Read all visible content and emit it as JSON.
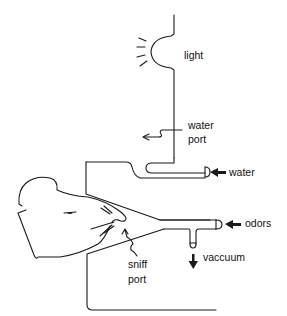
{
  "diagram": {
    "stroke_color": "#1a1a1a",
    "background": "#ffffff",
    "labels": {
      "light": "light",
      "water_port_line1": "water",
      "water_port_line2": "port",
      "water": "water",
      "odors": "odors",
      "vaccuum": "vaccuum",
      "sniff_port_line1": "sniff",
      "sniff_port_line2": "port"
    },
    "components": [
      {
        "id": "light",
        "icon": "light-bulb-icon"
      },
      {
        "id": "water-port",
        "icon": "squiggle-arrow-icon"
      },
      {
        "id": "water-tube",
        "icon": "arrow-left-icon"
      },
      {
        "id": "odor-tube",
        "icon": "arrow-left-icon"
      },
      {
        "id": "vacuum-outlet",
        "icon": "arrow-down-icon"
      },
      {
        "id": "sniff-port",
        "icon": "squiggle-arrow-icon"
      },
      {
        "id": "rat",
        "icon": "rat-head-icon"
      }
    ]
  }
}
